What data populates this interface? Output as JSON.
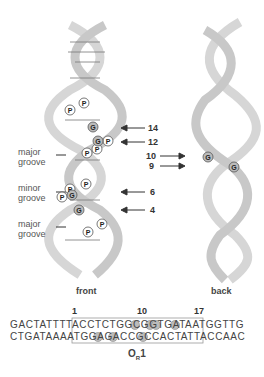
{
  "diagram": {
    "front_label": "front",
    "back_label": "back",
    "groove_labels": [
      {
        "text": "major\ngroove",
        "line1": "major",
        "line2": "groove"
      },
      {
        "text": "minor\ngroove",
        "line1": "minor",
        "line2": "groove"
      },
      {
        "text": "major\ngroove",
        "line1": "major",
        "line2": "groove"
      }
    ],
    "front_arrows": [
      "14",
      "12",
      "6",
      "4"
    ],
    "back_arrows": [
      "10",
      "9"
    ],
    "markers": {
      "phosphate": "P",
      "guanine": "G"
    },
    "sequence": {
      "positions": [
        "1",
        "10",
        "17"
      ],
      "top_strand": "GACTATTTTACCTCTGGCGGTGATAATGGTTG",
      "bottom_strand": "CTGATAAAATGGAGACCGCCACTATTACCAAC",
      "operator_label": "O",
      "operator_subscript": "R",
      "operator_suffix": "1"
    },
    "colors": {
      "ribbon": "#d8d8d8",
      "ribbon_edge": "#9a9a9a",
      "highlight": "#b0b0b0",
      "text": "#333333"
    }
  }
}
